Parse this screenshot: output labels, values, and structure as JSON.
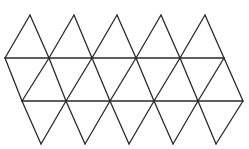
{
  "diagram": {
    "type": "icosahedron-net",
    "stroke_color": "#2a2a2a",
    "background_color": "#ffffff",
    "stroke_width": 1.3,
    "rows_y": [
      15,
      58,
      101,
      144
    ],
    "top_peaks_x": [
      30,
      74,
      117,
      161,
      205
    ],
    "row1_x": [
      5,
      49,
      92,
      136,
      180,
      224
    ],
    "row2_x": [
      22,
      66,
      110,
      154,
      198,
      243
    ],
    "bottom_points_x": [
      41,
      85,
      129,
      173,
      216
    ],
    "triangle_count": 20
  }
}
